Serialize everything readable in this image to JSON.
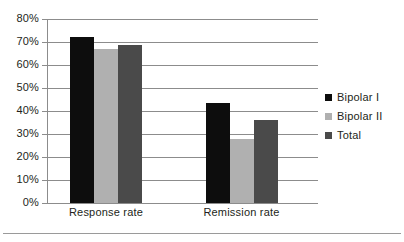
{
  "chart_data": {
    "type": "bar",
    "title": "",
    "xlabel": "",
    "ylabel": "",
    "categories": [
      "Response rate",
      "Remission rate"
    ],
    "series": [
      {
        "name": "Bipolar I",
        "values": [
          72,
          43.5
        ],
        "color": "#0d0d0d"
      },
      {
        "name": "Bipolar II",
        "values": [
          67,
          28
        ],
        "color": "#b0b0b0"
      },
      {
        "name": "Total",
        "values": [
          68.5,
          36
        ],
        "color": "#4a4a4a"
      }
    ],
    "ylim": [
      0,
      80
    ],
    "ytick_values": [
      0,
      10,
      20,
      30,
      40,
      50,
      60,
      70,
      80
    ],
    "ytick_labels": [
      "0%",
      "10%",
      "20%",
      "30%",
      "40%",
      "50%",
      "60%",
      "70%",
      "80%"
    ],
    "grid": true,
    "legend_position": "right",
    "value_suffix": "%"
  },
  "axis": {
    "y_labels": [
      "80%",
      "70%",
      "60%",
      "50%",
      "40%",
      "30%",
      "20%",
      "10%",
      "0%"
    ],
    "x_labels": [
      "Response rate",
      "Remission rate"
    ]
  },
  "legend": {
    "items": [
      {
        "label": "Bipolar I",
        "color": "#0d0d0d"
      },
      {
        "label": "Bipolar II",
        "color": "#b0b0b0"
      },
      {
        "label": "Total",
        "color": "#4a4a4a"
      }
    ]
  },
  "colors": {
    "bipolar_i": "#0d0d0d",
    "bipolar_ii": "#b0b0b0",
    "total": "#4a4a4a",
    "grid": "#8c8c8c",
    "text": "#231f20",
    "background": "#ffffff"
  }
}
